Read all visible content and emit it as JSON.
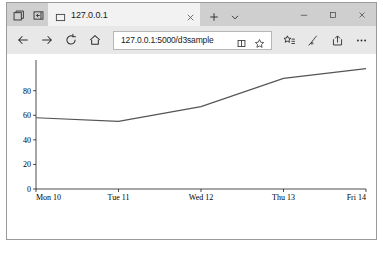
{
  "window": {
    "title": "127.0.0.1",
    "controls": {
      "minimize": "Minimize",
      "maximize": "Maximize",
      "close": "Close"
    }
  },
  "tab_strip": {
    "tab_overview_label": "Show tab previews",
    "set_aside_label": "Tabs you've set aside",
    "tab_title": "127.0.0.1",
    "tab_close_label": "Close tab",
    "new_tab_label": "New tab",
    "tab_list_label": "Tab options"
  },
  "nav": {
    "back_label": "Back",
    "forward_label": "Forward",
    "refresh_label": "Refresh",
    "home_label": "Home"
  },
  "address": {
    "url": "127.0.0.1:5000/d3sample",
    "placeholder": "Search or enter web address",
    "reading_view_label": "Reading view",
    "favorite_label": "Add to favorites"
  },
  "toolbar": {
    "favorites_hub_label": "Hub (favorites, reading list, history, downloads)",
    "web_note_label": "Make a Web Note",
    "share_label": "Share",
    "more_label": "Settings and more"
  },
  "icons": {
    "tab_overview": "tab-overview-icon",
    "set_aside": "set-aside-tabs-icon",
    "tab_favicon": "page-icon",
    "tab_close": "close-icon",
    "new_tab": "plus-icon",
    "tab_list": "chevron-down-icon",
    "back": "arrow-left-icon",
    "forward": "arrow-right-icon",
    "refresh": "refresh-icon",
    "home": "home-icon",
    "reading_view": "book-icon",
    "favorite": "star-icon",
    "favorites_hub": "star-list-icon",
    "web_note": "pen-icon",
    "share": "share-icon",
    "more": "ellipsis-icon",
    "minimize": "minimize-icon",
    "maximize": "maximize-icon",
    "close_window": "close-icon"
  },
  "colors": {
    "tab_strip_bg": "#cfcfcf",
    "nav_bar_bg": "#e8e8e8",
    "active_tab_bg": "#f2f2f2",
    "page_bg": "#ffffff",
    "line_stroke": "#555555",
    "axis_stroke": "#000000"
  },
  "chart_data": {
    "type": "line",
    "title": "",
    "xlabel": "",
    "ylabel": "",
    "x": [
      "Mon 10",
      "Tue 11",
      "Wed 12",
      "Thu 13",
      "Fri 14"
    ],
    "values": [
      58,
      55,
      67,
      90,
      98
    ],
    "series": [
      {
        "name": "value",
        "values": [
          58,
          55,
          67,
          90,
          98
        ]
      }
    ],
    "xtick_labels": [
      "Mon 10",
      "Tue 11",
      "Wed 12",
      "Thu 13",
      "Fri 14"
    ],
    "ytick_labels": [
      "0",
      "20",
      "40",
      "60",
      "80"
    ],
    "yticks": [
      0,
      20,
      40,
      60,
      80
    ],
    "ylim": [
      0,
      105
    ],
    "grid": false,
    "legend": false
  }
}
